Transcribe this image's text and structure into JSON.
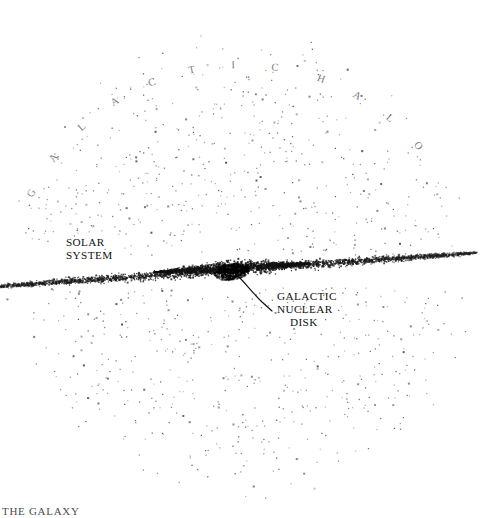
{
  "figure": {
    "title_caption": "THE GALAXY",
    "background_color": "#ffffff",
    "ink_color": "#111111",
    "width": 482,
    "height": 518
  },
  "labels": {
    "halo": {
      "text": "GALACTIC HALO",
      "letters": [
        "G",
        "A",
        "L",
        "A",
        "C",
        "T",
        "I",
        "C",
        "H",
        "A",
        "L",
        "O"
      ],
      "style": "arc"
    },
    "solar_system": {
      "line1": "SOLAR",
      "line2": "SYSTEM"
    },
    "nuclear_disk": {
      "line1": "GALACTIC",
      "line2": "NUCLEAR",
      "line3": "DISK"
    }
  },
  "components": {
    "halo": {
      "name": "galactic-halo",
      "shape": "circle",
      "center_x": 241,
      "center_y": 268,
      "radius": 238,
      "star_count": 1500,
      "color": "#2b2b2b"
    },
    "disk": {
      "name": "galactic-disk",
      "shape": "edge-on-lens",
      "center_x": 232,
      "center_y": 270,
      "half_length": 245,
      "tilt_degrees": -4,
      "star_count": 2600,
      "color": "#1a1a1a"
    },
    "bulge": {
      "name": "central-bulge",
      "shape": "lens",
      "center_x": 232,
      "center_y": 268,
      "half_width": 78,
      "half_height": 26,
      "star_count": 2400,
      "color": "#121212"
    },
    "nucleus": {
      "name": "galactic-nucleus",
      "shape": "ellipse",
      "center_x": 232,
      "center_y": 272,
      "rx": 17,
      "ry": 8,
      "star_count": 420,
      "color": "#000000"
    }
  }
}
